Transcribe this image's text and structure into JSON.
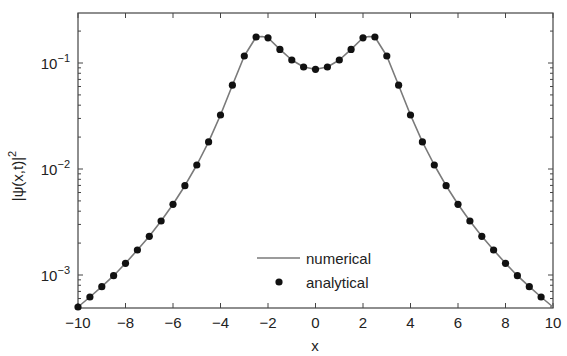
{
  "chart_data": {
    "type": "line",
    "title": "",
    "xlabel": "x",
    "ylabel": "|ψ(x,t)|",
    "ylabel_sup": "2",
    "xlim": [
      -10,
      10
    ],
    "ylim": [
      0.000495,
      0.3
    ],
    "yscale": "log",
    "grid": false,
    "legend_position": "lower center",
    "xticks": [
      -10,
      -8,
      -6,
      -4,
      -2,
      0,
      2,
      4,
      6,
      8,
      10
    ],
    "xtick_labels": [
      "−10",
      "−8",
      "−6",
      "−4",
      "−2",
      "0",
      "2",
      "4",
      "6",
      "8",
      "10"
    ],
    "yticks": [
      0.001,
      0.01,
      0.1
    ],
    "ytick_labels": [
      {
        "base": "10",
        "exp": "−3"
      },
      {
        "base": "10",
        "exp": "−2"
      },
      {
        "base": "10",
        "exp": "−1"
      }
    ],
    "series": [
      {
        "name": "numerical",
        "style": "line",
        "color": "#7a7a7a",
        "x": [
          -10,
          -9.5,
          -9,
          -8.5,
          -8,
          -7.5,
          -7,
          -6.5,
          -6,
          -5.5,
          -5,
          -4.5,
          -4,
          -3.5,
          -3,
          -2.5,
          -2.25,
          -2,
          -1.5,
          -1,
          -0.5,
          0,
          0.5,
          1,
          1.5,
          2,
          2.25,
          2.5,
          3,
          3.5,
          4,
          4.5,
          5,
          5.5,
          6,
          6.5,
          7,
          7.5,
          8,
          8.5,
          9,
          9.5,
          10
        ],
        "values": [
          0.000499,
          0.00062,
          0.000776,
          0.000984,
          0.00129,
          0.00172,
          0.00232,
          0.00323,
          0.00464,
          0.00695,
          0.0109,
          0.018,
          0.0323,
          0.0617,
          0.1165,
          0.176,
          0.178,
          0.173,
          0.1345,
          0.1067,
          0.0917,
          0.0872,
          0.0917,
          0.1067,
          0.1345,
          0.173,
          0.178,
          0.176,
          0.1165,
          0.0617,
          0.0323,
          0.018,
          0.0109,
          0.00695,
          0.00464,
          0.00323,
          0.00232,
          0.00172,
          0.00129,
          0.000984,
          0.000776,
          0.00062,
          0.000499
        ]
      },
      {
        "name": "analytical",
        "style": "markers",
        "color": "#111111",
        "x": [
          -10,
          -9.5,
          -9,
          -8.5,
          -8,
          -7.5,
          -7,
          -6.5,
          -6,
          -5.5,
          -5,
          -4.5,
          -4,
          -3.5,
          -3,
          -2.5,
          -2,
          -1.5,
          -1,
          -0.5,
          0,
          0.5,
          1,
          1.5,
          2,
          2.5,
          3,
          3.5,
          4,
          4.5,
          5,
          5.5,
          6,
          6.5,
          7,
          7.5,
          8,
          8.5,
          9,
          9.5
        ],
        "values": [
          0.000499,
          0.00062,
          0.000776,
          0.000984,
          0.00129,
          0.00172,
          0.00232,
          0.00323,
          0.00464,
          0.00695,
          0.0109,
          0.018,
          0.0323,
          0.0617,
          0.1165,
          0.176,
          0.173,
          0.1345,
          0.1067,
          0.0917,
          0.0872,
          0.0917,
          0.1067,
          0.1345,
          0.173,
          0.176,
          0.1165,
          0.0617,
          0.0323,
          0.018,
          0.0109,
          0.00695,
          0.00464,
          0.00323,
          0.00232,
          0.00172,
          0.00129,
          0.000984,
          0.000776,
          0.00062
        ]
      }
    ]
  },
  "legend": {
    "items": [
      {
        "label": "numerical",
        "symbol": "line"
      },
      {
        "label": "analytical",
        "symbol": "dot"
      }
    ]
  },
  "colors": {
    "axes": "#444444",
    "line": "#7a7a7a",
    "marker": "#111111",
    "text": "#222222"
  }
}
